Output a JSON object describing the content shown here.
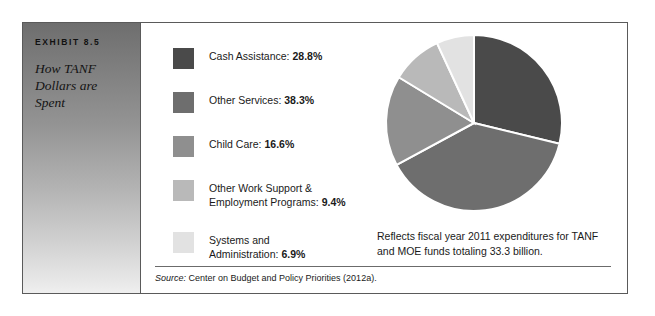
{
  "exhibit": {
    "number": "EXHIBIT 8.5",
    "title": "How TANF Dollars are Spent"
  },
  "legend": {
    "items": [
      {
        "label": "Cash Assistance: ",
        "percent": "28.8%",
        "color": "#4a4a4a",
        "swatch_name": "legend-swatch-cash-assistance"
      },
      {
        "label": "Other Services: ",
        "percent": "38.3%",
        "color": "#6e6e6e",
        "swatch_name": "legend-swatch-other-services"
      },
      {
        "label": "Child Care: ",
        "percent": "16.6%",
        "color": "#8f8f8f",
        "swatch_name": "legend-swatch-child-care"
      },
      {
        "label": "Other Work Support &\nEmployment Programs: ",
        "percent": "9.4%",
        "color": "#b9b9b9",
        "swatch_name": "legend-swatch-other-work-support"
      },
      {
        "label": "Systems and\nAdministration: ",
        "percent": "6.9%",
        "color": "#e2e2e2",
        "swatch_name": "legend-swatch-systems-administration"
      }
    ]
  },
  "caption": "Reflects fiscal year 2011 expenditures for TANF and MOE funds totaling 33.3 billion.",
  "source": {
    "label": "Source:",
    "text": " Center on Budget and Policy Priorities (2012a)."
  },
  "chart_data": {
    "type": "pie",
    "title": "How TANF Dollars are Spent",
    "unit": "percent",
    "start_angle_deg": 0,
    "direction": "clockwise",
    "legend_position": "left",
    "total_label": "33.3 billion",
    "categories": [
      "Cash Assistance",
      "Other Services",
      "Child Care",
      "Other Work Support & Employment Programs",
      "Systems and Administration"
    ],
    "values": [
      28.8,
      38.3,
      16.6,
      9.4,
      6.9
    ],
    "colors": [
      "#4a4a4a",
      "#6e6e6e",
      "#8f8f8f",
      "#b9b9b9",
      "#e2e2e2"
    ],
    "slice_separator_color": "#ffffff"
  }
}
